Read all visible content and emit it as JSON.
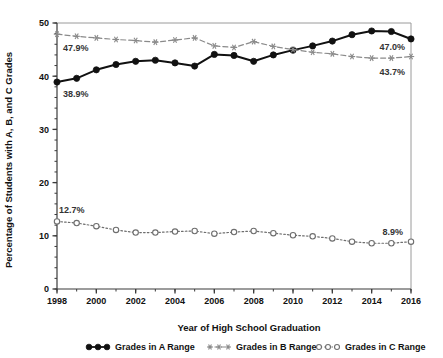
{
  "chart_data": {
    "type": "line",
    "title": "",
    "xlabel": "Year of High School Graduation",
    "ylabel": "Percentage of Students with A, B, and C Grades",
    "xlim": [
      1998,
      2016
    ],
    "ylim": [
      0,
      50
    ],
    "ytick_labels": [
      "0",
      "10",
      "20",
      "30",
      "40",
      "50"
    ],
    "ytick_values": [
      0,
      10,
      20,
      30,
      40,
      50
    ],
    "ytick_minor_step": 2,
    "xtick_labels": [
      "1998",
      "2000",
      "2002",
      "2004",
      "2006",
      "2008",
      "2010",
      "2012",
      "2014",
      "2016"
    ],
    "xtick_values": [
      1998,
      2000,
      2002,
      2004,
      2006,
      2008,
      2010,
      2012,
      2014,
      2016
    ],
    "xtick_minor_step": 1,
    "grid": false,
    "legend_position": "bottom",
    "x": [
      1998,
      1999,
      2000,
      2001,
      2002,
      2003,
      2004,
      2005,
      2006,
      2007,
      2008,
      2009,
      2010,
      2011,
      2012,
      2013,
      2014,
      2015,
      2016
    ],
    "series": [
      {
        "name": "Grades in A Range",
        "marker": "filled-circle",
        "line_style": "solid",
        "color": "#111111",
        "values": [
          38.9,
          39.6,
          41.2,
          42.2,
          42.8,
          43.0,
          42.5,
          41.9,
          44.1,
          43.9,
          42.8,
          44.0,
          44.9,
          45.7,
          46.6,
          47.8,
          48.5,
          48.4,
          47.0
        ]
      },
      {
        "name": "Grades in B Range",
        "marker": "asterisk",
        "line_style": "dashed",
        "color": "#8a8a8a",
        "values": [
          47.9,
          47.5,
          47.2,
          46.9,
          46.7,
          46.4,
          46.8,
          47.2,
          45.7,
          45.4,
          46.5,
          45.6,
          45.0,
          44.5,
          44.2,
          43.7,
          43.4,
          43.4,
          43.7
        ]
      },
      {
        "name": "Grades in C Range",
        "marker": "open-circle",
        "line_style": "dotted",
        "color": "#6e6e6e",
        "values": [
          12.7,
          12.4,
          11.8,
          11.1,
          10.6,
          10.6,
          10.8,
          10.9,
          10.4,
          10.7,
          10.9,
          10.5,
          10.1,
          9.9,
          9.5,
          8.9,
          8.6,
          8.6,
          8.9
        ]
      }
    ],
    "annotations": [
      {
        "id": "a-start",
        "text": "38.9%",
        "series": "Grades in A Range",
        "x": 1998,
        "y": 38.9
      },
      {
        "id": "a-end",
        "text": "47.0%",
        "series": "Grades in A Range",
        "x": 2016,
        "y": 47.0
      },
      {
        "id": "b-start",
        "text": "47.9%",
        "series": "Grades in B Range",
        "x": 1998,
        "y": 47.9
      },
      {
        "id": "b-end",
        "text": "43.7%",
        "series": "Grades in B Range",
        "x": 2016,
        "y": 43.7
      },
      {
        "id": "c-start",
        "text": "12.7%",
        "series": "Grades in C Range",
        "x": 1998,
        "y": 12.7
      },
      {
        "id": "c-end",
        "text": "8.9%",
        "series": "Grades in C Range",
        "x": 2016,
        "y": 8.9
      }
    ]
  },
  "legend": {
    "items": [
      {
        "label": "Grades in A Range",
        "marker": "filled-circle",
        "color": "#111111"
      },
      {
        "label": "Grades in B Range",
        "marker": "asterisk",
        "color": "#8a8a8a"
      },
      {
        "label": "Grades in C Range",
        "marker": "open-circle",
        "color": "#6e6e6e"
      }
    ]
  },
  "axes": {
    "x_title": "Year of High School Graduation",
    "y_title": "Percentage of Students with A, B, and C Grades"
  },
  "annotation_text": {
    "a_start": "38.9%",
    "a_end": "47.0%",
    "b_start": "47.9%",
    "b_end": "43.7%",
    "c_start": "12.7%",
    "c_end": "8.9%"
  }
}
